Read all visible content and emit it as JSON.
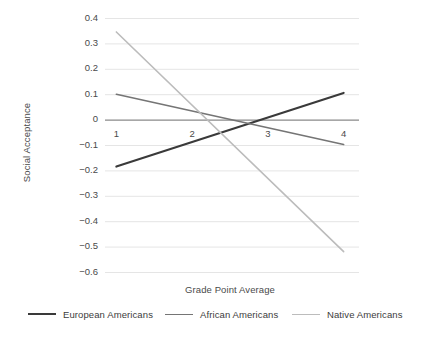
{
  "chart_data": {
    "type": "line",
    "title": "",
    "xlabel": "Grade Point Average",
    "ylabel": "Social Acceptance",
    "x": [
      1,
      4
    ],
    "xlim": [
      0.85,
      4.15
    ],
    "ylim": [
      -0.6,
      0.4
    ],
    "x_tick_labels": [
      "1",
      "2",
      "3",
      "4"
    ],
    "x_tick_values": [
      1,
      2,
      3,
      4
    ],
    "y_tick_labels": [
      "0.4",
      "0.3",
      "0.2",
      "0.1",
      "0",
      "-0.1",
      "-0.2",
      "-0.3",
      "-0.4",
      "-0.5",
      "-0.6"
    ],
    "y_tick_values": [
      0.4,
      0.3,
      0.2,
      0.1,
      0,
      -0.1,
      -0.2,
      -0.3,
      -0.4,
      -0.5,
      -0.6
    ],
    "grid": true,
    "grid_axis": "y",
    "zero_line": true,
    "legend_position": "bottom",
    "series": [
      {
        "name": "European Americans",
        "color": "#3a3a3a",
        "width": 2.1,
        "values": [
          -0.185,
          0.105
        ],
        "points": [
          {
            "x": 1,
            "y": -0.185
          },
          {
            "x": 4,
            "y": 0.105
          }
        ]
      },
      {
        "name": "African Americans",
        "color": "#757575",
        "width": 1.6,
        "values": [
          0.1,
          -0.098
        ],
        "points": [
          {
            "x": 1,
            "y": 0.1
          },
          {
            "x": 4,
            "y": -0.098
          }
        ]
      },
      {
        "name": "Native Americans",
        "color": "#bcbcbc",
        "width": 1.6,
        "values": [
          0.345,
          -0.52
        ],
        "points": [
          {
            "x": 1,
            "y": 0.345
          },
          {
            "x": 4,
            "y": -0.52
          }
        ]
      }
    ]
  },
  "axes": {
    "y_title": "Social Acceptance",
    "x_title": "Grade Point Average",
    "y_ticks": [
      {
        "label": "0.4"
      },
      {
        "label": "0.3"
      },
      {
        "label": "0.2"
      },
      {
        "label": "0.1"
      },
      {
        "label": "0"
      },
      {
        "label": "-0.1"
      },
      {
        "label": "-0.2"
      },
      {
        "label": "-0.3"
      },
      {
        "label": "-0.4"
      },
      {
        "label": "-0.5"
      },
      {
        "label": "-0.6"
      }
    ],
    "x_ticks": [
      {
        "label": "1"
      },
      {
        "label": "2"
      },
      {
        "label": "3"
      },
      {
        "label": "4"
      }
    ]
  },
  "legend": {
    "items": [
      {
        "label": "European Americans",
        "color": "#3a3a3a"
      },
      {
        "label": "African Americans",
        "color": "#757575"
      },
      {
        "label": "Native Americans",
        "color": "#bcbcbc"
      }
    ]
  },
  "colors": {
    "background": "#ffffff",
    "grid": "#e2e2e2",
    "zero_line": "#8a8a8a",
    "text": "#4a4a4a"
  }
}
